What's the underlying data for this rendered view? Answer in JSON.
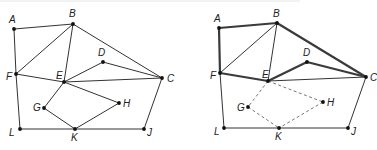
{
  "figure": {
    "colors": {
      "edge": "#333333",
      "thick_edge": "#3a3a3a",
      "dashed_edge": "#777777",
      "node": "#111111",
      "label": "#222222"
    }
  },
  "left_graph": {
    "nodes": {
      "A": {
        "label": "A",
        "x": 14,
        "y": 29,
        "lx": 9,
        "ly": 23
      },
      "B": {
        "label": "B",
        "x": 73,
        "y": 24,
        "lx": 69,
        "ly": 17
      },
      "C": {
        "label": "C",
        "x": 162,
        "y": 78,
        "lx": 167,
        "ly": 82
      },
      "D": {
        "label": "D",
        "x": 103,
        "y": 62,
        "lx": 98,
        "ly": 56
      },
      "E": {
        "label": "E",
        "x": 64,
        "y": 82,
        "lx": 56,
        "ly": 79
      },
      "F": {
        "label": "F",
        "x": 16,
        "y": 74,
        "lx": 6,
        "ly": 80
      },
      "G": {
        "label": "G",
        "x": 44,
        "y": 108,
        "lx": 33,
        "ly": 111
      },
      "H": {
        "label": "H",
        "x": 119,
        "y": 103,
        "lx": 123,
        "ly": 107
      },
      "J": {
        "label": "J",
        "x": 144,
        "y": 129,
        "lx": 147,
        "ly": 136
      },
      "K": {
        "label": "K",
        "x": 75,
        "y": 129,
        "lx": 71,
        "ly": 141
      },
      "L": {
        "label": "L",
        "x": 20,
        "y": 129,
        "lx": 9,
        "ly": 136
      }
    },
    "edges": [
      [
        "A",
        "B"
      ],
      [
        "A",
        "F"
      ],
      [
        "B",
        "F"
      ],
      [
        "B",
        "E"
      ],
      [
        "B",
        "C"
      ],
      [
        "F",
        "E"
      ],
      [
        "F",
        "L"
      ],
      [
        "E",
        "C"
      ],
      [
        "E",
        "D"
      ],
      [
        "D",
        "C"
      ],
      [
        "E",
        "G"
      ],
      [
        "E",
        "H"
      ],
      [
        "G",
        "K"
      ],
      [
        "H",
        "K"
      ],
      [
        "L",
        "K"
      ],
      [
        "K",
        "J"
      ],
      [
        "C",
        "J"
      ]
    ]
  },
  "right_graph": {
    "nodes": {
      "A": {
        "label": "A",
        "x": 219,
        "y": 28,
        "lx": 214,
        "ly": 22
      },
      "B": {
        "label": "B",
        "x": 277,
        "y": 23,
        "lx": 273,
        "ly": 17
      },
      "C": {
        "label": "C",
        "x": 366,
        "y": 77,
        "lx": 370,
        "ly": 81
      },
      "D": {
        "label": "D",
        "x": 307,
        "y": 62,
        "lx": 303,
        "ly": 56
      },
      "E": {
        "label": "E",
        "x": 268,
        "y": 81,
        "lx": 262,
        "ly": 78
      },
      "F": {
        "label": "F",
        "x": 220,
        "y": 73,
        "lx": 210,
        "ly": 79
      },
      "G": {
        "label": "G",
        "x": 248,
        "y": 107,
        "lx": 237,
        "ly": 111
      },
      "H": {
        "label": "H",
        "x": 323,
        "y": 102,
        "lx": 327,
        "ly": 106
      },
      "J": {
        "label": "J",
        "x": 348,
        "y": 128,
        "lx": 351,
        "ly": 135
      },
      "K": {
        "label": "K",
        "x": 279,
        "y": 128,
        "lx": 275,
        "ly": 140
      },
      "L": {
        "label": "L",
        "x": 224,
        "y": 128,
        "lx": 214,
        "ly": 135
      }
    },
    "thick_edges": [
      [
        "A",
        "B"
      ],
      [
        "A",
        "F"
      ],
      [
        "F",
        "E"
      ],
      [
        "E",
        "D"
      ],
      [
        "D",
        "C"
      ],
      [
        "B",
        "C"
      ]
    ],
    "thin_edges": [
      [
        "B",
        "F"
      ],
      [
        "B",
        "E"
      ],
      [
        "E",
        "C"
      ],
      [
        "F",
        "L"
      ],
      [
        "L",
        "K"
      ],
      [
        "K",
        "J"
      ],
      [
        "C",
        "J"
      ]
    ],
    "dashed_edges": [
      [
        "E",
        "G"
      ],
      [
        "G",
        "K"
      ],
      [
        "E",
        "H"
      ],
      [
        "H",
        "K"
      ]
    ]
  }
}
